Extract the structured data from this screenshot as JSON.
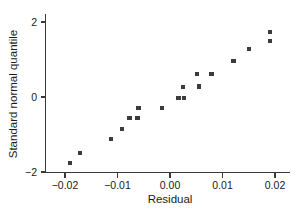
{
  "chart_data": {
    "type": "scatter",
    "title": "",
    "xlabel": "Residual",
    "ylabel": "Standard normal quantile",
    "xlim": [
      -0.0235,
      0.0245
    ],
    "ylim": [
      -2.62,
      2.45
    ],
    "xticks": [
      -0.02,
      -0.01,
      0.0,
      0.01,
      0.02
    ],
    "xticklabels": [
      "-0.02",
      "-0.01",
      "0.00",
      "0.01",
      "0.02"
    ],
    "yticks": [
      -2,
      0,
      2
    ],
    "yticklabels": [
      "-2",
      "0",
      "2"
    ],
    "grid": false,
    "legend": null,
    "marker": "square",
    "marker_color": "#3b3b3b",
    "points": [
      {
        "x": -0.019,
        "y": -1.75
      },
      {
        "x": -0.0172,
        "y": -1.5
      },
      {
        "x": -0.0113,
        "y": -1.11
      },
      {
        "x": -0.0092,
        "y": -0.85
      },
      {
        "x": -0.0077,
        "y": -0.56
      },
      {
        "x": -0.0062,
        "y": -0.56
      },
      {
        "x": -0.006,
        "y": -0.29
      },
      {
        "x": -0.0016,
        "y": -0.3
      },
      {
        "x": 0.0016,
        "y": -0.02
      },
      {
        "x": 0.0026,
        "y": -0.02
      },
      {
        "x": 0.0025,
        "y": 0.26
      },
      {
        "x": 0.0052,
        "y": 0.62
      },
      {
        "x": 0.0055,
        "y": 0.28
      },
      {
        "x": 0.0079,
        "y": 0.62
      },
      {
        "x": 0.0121,
        "y": 0.97
      },
      {
        "x": 0.015,
        "y": 1.29
      },
      {
        "x": 0.019,
        "y": 1.74
      },
      {
        "x": 0.0191,
        "y": 1.5
      }
    ]
  },
  "axes": {
    "x_title": "Residual",
    "y_title": "Standard normal quantile"
  }
}
